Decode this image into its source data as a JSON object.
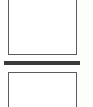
{
  "document": {
    "kind": "scanned-page-fragment",
    "description": "Blank scanned document fragment with two empty outlined frames separated by a thick horizontal rule",
    "page_background": "#fefefe",
    "margin_tint": "#fdfdfc",
    "text_content": "",
    "elements": [
      {
        "name": "upper-frame",
        "shape": "rectangle",
        "fill": "#ffffff",
        "border_color": "#5c5c5c",
        "border_width_px": 1.5,
        "clipped_edge": "top",
        "content": ""
      },
      {
        "name": "divider-rule",
        "shape": "horizontal-bar",
        "fill": "#3a3a3a",
        "thickness_px": 4,
        "content": ""
      },
      {
        "name": "lower-frame",
        "shape": "rectangle",
        "fill": "#ffffff",
        "border_color": "#5c5c5c",
        "border_width_px": 1.5,
        "clipped_edge": "bottom",
        "content": ""
      }
    ]
  }
}
